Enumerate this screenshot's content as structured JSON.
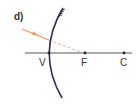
{
  "diagram": {
    "part_label": "d)",
    "type": "convex mirror ray diagram",
    "points": [
      {
        "name": "V",
        "label": "V"
      },
      {
        "name": "F",
        "label": "F"
      },
      {
        "name": "C",
        "label": "C"
      }
    ],
    "colors": {
      "mirror": "#2b2f5a",
      "axis": "#444444",
      "incident_ray": "#e8955a",
      "dashed_extension": "#e8b48a",
      "text": "#333333"
    }
  }
}
